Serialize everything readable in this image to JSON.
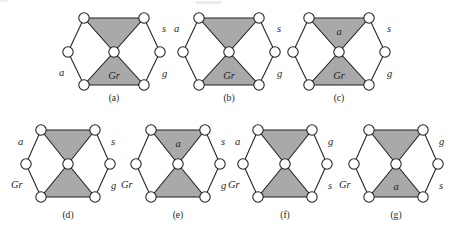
{
  "figure": {
    "title_visible": false,
    "background_color": "#ffffff",
    "node_fill": "#ffffff",
    "node_stroke": "#231f20",
    "triangle_fill": "#a9a9a9",
    "edge_color": "#231f20",
    "diagram_count": 7
  },
  "diagrams": [
    {
      "caption": "(a)",
      "inner_top_label": "",
      "inner_bottom_label": "Gr",
      "outer_labels": {
        "upper_left": "",
        "lower_left": "a",
        "upper_right": "s",
        "lower_right": "g"
      },
      "nodes": 7,
      "shaded_triangles": [
        "top",
        "bottom"
      ]
    },
    {
      "caption": "(b)",
      "inner_top_label": "",
      "inner_bottom_label": "Gr",
      "outer_labels": {
        "upper_left": "a",
        "lower_left": "",
        "upper_right": "s",
        "lower_right": "g"
      },
      "nodes": 7,
      "shaded_triangles": [
        "top",
        "bottom"
      ]
    },
    {
      "caption": "(c)",
      "inner_top_label": "a",
      "inner_bottom_label": "Gr",
      "outer_labels": {
        "upper_left": "",
        "lower_left": "",
        "upper_right": "s",
        "lower_right": "g"
      },
      "nodes": 7,
      "shaded_triangles": [
        "top",
        "bottom"
      ]
    },
    {
      "caption": "(d)",
      "inner_top_label": "",
      "inner_bottom_label": "",
      "outer_labels": {
        "upper_left": "a",
        "lower_left": "Gr",
        "upper_right": "s",
        "lower_right": "g"
      },
      "nodes": 7,
      "shaded_triangles": [
        "top",
        "bottom"
      ]
    },
    {
      "caption": "(e)",
      "inner_top_label": "a",
      "inner_bottom_label": "",
      "outer_labels": {
        "upper_left": "",
        "lower_left": "Gr",
        "upper_right": "s",
        "lower_right": "g"
      },
      "nodes": 7,
      "shaded_triangles": [
        "top",
        "bottom"
      ]
    },
    {
      "caption": "(f)",
      "inner_top_label": "",
      "inner_bottom_label": "",
      "outer_labels": {
        "upper_left": "a",
        "lower_left": "Gr",
        "upper_right": "g",
        "lower_right": "s"
      },
      "nodes": 7,
      "shaded_triangles": [
        "top",
        "bottom"
      ]
    },
    {
      "caption": "(g)",
      "inner_top_label": "",
      "inner_bottom_label": "a",
      "outer_labels": {
        "upper_left": "",
        "lower_left": "Gr",
        "upper_right": "g",
        "lower_right": "s"
      },
      "nodes": 7,
      "shaded_triangles": [
        "top",
        "bottom"
      ]
    }
  ]
}
